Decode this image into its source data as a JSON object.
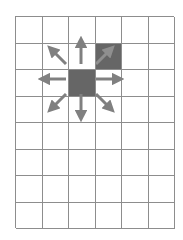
{
  "figure": {
    "background_color": "#ffffff"
  },
  "grid": {
    "columns": 6,
    "rows": 8,
    "cell_size_px": 26.5,
    "border_color": "#8d8d8d",
    "fill_color": "#666666",
    "origin_x_px": 15,
    "origin_y_px": 16,
    "filled_cells": [
      {
        "row": 2,
        "column": 4,
        "label": "target-cell"
      },
      {
        "row": 3,
        "column": 3,
        "label": "source-cell"
      }
    ]
  },
  "arrows": {
    "color": "#808080",
    "overlay_color": "#8f8f8f",
    "origin": {
      "row": 3,
      "column": 3
    },
    "directions": [
      {
        "name": "up",
        "symbol": "↑"
      },
      {
        "name": "down",
        "symbol": "↓"
      },
      {
        "name": "left",
        "symbol": "←"
      },
      {
        "name": "right",
        "symbol": "→"
      },
      {
        "name": "up-left",
        "symbol": "↖"
      },
      {
        "name": "up-right",
        "symbol": "↗"
      },
      {
        "name": "down-left",
        "symbol": "↙"
      },
      {
        "name": "down-right",
        "symbol": "↘"
      }
    ],
    "count": 8
  }
}
